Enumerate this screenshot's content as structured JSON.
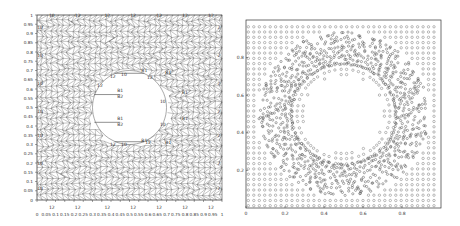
{
  "chart_data": [
    {
      "type": "mesh",
      "title": "",
      "description": "Triangular finite-element mesh of unit square with central circular hole",
      "xlabel": "",
      "ylabel": "",
      "xlim": [
        0,
        1
      ],
      "ylim": [
        0,
        1
      ],
      "xticks": [
        "0",
        "0.05",
        "0.1",
        "0.15",
        "0.2",
        "0.25",
        "0.3",
        "0.35",
        "0.4",
        "0.45",
        "0.5",
        "0.55",
        "0.6",
        "0.65",
        "0.7",
        "0.75",
        "0.8",
        "0.85",
        "0.9",
        "0.95",
        "1"
      ],
      "yticks": [
        "0",
        "0.05",
        "0.1",
        "0.15",
        "0.2",
        "0.25",
        "0.3",
        "0.35",
        "0.4",
        "0.45",
        "0.5",
        "0.55",
        "0.6",
        "0.65",
        "0.7",
        "0.75",
        "0.8",
        "0.85",
        "0.9",
        "0.95",
        "1"
      ],
      "hole": {
        "cx": 0.5,
        "cy": 0.5,
        "r": 0.2
      },
      "boundary_labels": [
        {
          "text": "12",
          "x": 0.08,
          "y": -0.02
        },
        {
          "text": "12",
          "x": 0.22,
          "y": -0.02
        },
        {
          "text": "12",
          "x": 0.38,
          "y": -0.02
        },
        {
          "text": "12",
          "x": 0.52,
          "y": -0.02
        },
        {
          "text": "12",
          "x": 0.66,
          "y": -0.02
        },
        {
          "text": "12",
          "x": 0.8,
          "y": -0.02
        },
        {
          "text": "12",
          "x": 0.94,
          "y": -0.02
        },
        {
          "text": "10",
          "x": 0.08,
          "y": 1.0
        },
        {
          "text": "12",
          "x": 0.22,
          "y": 1.0
        },
        {
          "text": "12",
          "x": 0.38,
          "y": 1.0
        },
        {
          "text": "12",
          "x": 0.52,
          "y": 1.0
        },
        {
          "text": "12",
          "x": 0.66,
          "y": 1.0
        },
        {
          "text": "12",
          "x": 0.8,
          "y": 1.0
        },
        {
          "text": "12",
          "x": 0.94,
          "y": 1.0
        },
        {
          "text": "10",
          "x": 0.0,
          "y": 0.93
        },
        {
          "text": "10",
          "x": 0.0,
          "y": 0.78
        },
        {
          "text": "10",
          "x": 0.0,
          "y": 0.63
        },
        {
          "text": "10",
          "x": 0.0,
          "y": 0.48
        },
        {
          "text": "10",
          "x": 0.0,
          "y": 0.35
        },
        {
          "text": "10",
          "x": 0.0,
          "y": 0.2
        },
        {
          "text": "10",
          "x": 0.0,
          "y": 0.06
        },
        {
          "text": "2",
          "x": 1.0,
          "y": 0.93
        },
        {
          "text": "2",
          "x": 1.0,
          "y": 0.78
        },
        {
          "text": "2",
          "x": 1.0,
          "y": 0.63
        },
        {
          "text": "2",
          "x": 1.0,
          "y": 0.48
        },
        {
          "text": "2",
          "x": 1.0,
          "y": 0.35
        },
        {
          "text": "2",
          "x": 1.0,
          "y": 0.2
        },
        {
          "text": "2",
          "x": 1.0,
          "y": 0.06
        },
        {
          "text": "12",
          "x": 0.41,
          "y": 0.67
        },
        {
          "text": "10",
          "x": 0.47,
          "y": 0.68
        },
        {
          "text": "B1",
          "x": 0.58,
          "y": 0.7
        },
        {
          "text": "B1",
          "x": 0.71,
          "y": 0.69
        },
        {
          "text": "12",
          "x": 0.61,
          "y": 0.66
        },
        {
          "text": "12",
          "x": 0.34,
          "y": 0.62
        },
        {
          "text": "B1",
          "x": 0.45,
          "y": 0.59
        },
        {
          "text": "B2",
          "x": 0.45,
          "y": 0.56
        },
        {
          "text": "B1",
          "x": 0.45,
          "y": 0.44
        },
        {
          "text": "B2",
          "x": 0.45,
          "y": 0.41
        },
        {
          "text": "B1",
          "x": 0.8,
          "y": 0.58
        },
        {
          "text": "10",
          "x": 0.68,
          "y": 0.53
        },
        {
          "text": "B1",
          "x": 0.8,
          "y": 0.44
        },
        {
          "text": "10",
          "x": 0.68,
          "y": 0.41
        },
        {
          "text": "B1",
          "x": 0.58,
          "y": 0.32
        },
        {
          "text": "12",
          "x": 0.41,
          "y": 0.3
        },
        {
          "text": "10",
          "x": 0.47,
          "y": 0.3
        },
        {
          "text": "12",
          "x": 0.6,
          "y": 0.31
        },
        {
          "text": "B1",
          "x": 0.71,
          "y": 0.31
        }
      ],
      "hole_segments": [
        {
          "x1": 0.31,
          "y1": 0.57,
          "x2": 0.45,
          "y2": 0.57,
          "label": "B1"
        },
        {
          "x1": 0.31,
          "y1": 0.42,
          "x2": 0.45,
          "y2": 0.42,
          "label": "B1"
        },
        {
          "x1": 0.42,
          "y1": 0.685,
          "x2": 0.58,
          "y2": 0.685,
          "label": ""
        },
        {
          "x1": 0.42,
          "y1": 0.315,
          "x2": 0.58,
          "y2": 0.315,
          "label": ""
        }
      ],
      "grid": false,
      "mesh_color": "#555555"
    },
    {
      "type": "scatter",
      "title": "",
      "description": "Particle/node distribution on unit square with central hole; dense disordered ring around the hole",
      "xlabel": "",
      "ylabel": "",
      "xlim": [
        0,
        1
      ],
      "ylim": [
        0,
        1
      ],
      "xticks": [
        "0",
        "0.2",
        "0.4",
        "0.6",
        "0.8"
      ],
      "yticks": [
        "0.2",
        "0.4",
        "0.6",
        "0.8"
      ],
      "marker": "o",
      "marker_color": "#777777",
      "hole": {
        "cx": 0.5,
        "cy": 0.5,
        "r": 0.2
      },
      "dense_ring": {
        "r_inner": 0.27,
        "r_outer": 0.45
      },
      "grid": false,
      "legend": null
    }
  ]
}
